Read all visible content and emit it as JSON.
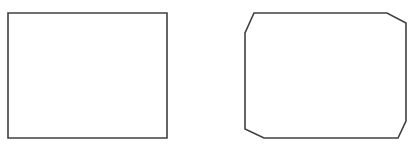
{
  "canvas": {
    "width": 417,
    "height": 154,
    "background": "#ffffff"
  },
  "stroke": {
    "color": "#404040",
    "width": 1.6
  },
  "shapes": [
    {
      "name": "rectangle",
      "points": "8,13 167,13 167,138 8,138"
    },
    {
      "name": "beveled-rectangle",
      "points": "254,13 387,13 406,23 406,121 398,138 264,138 245,129 245,33"
    }
  ]
}
